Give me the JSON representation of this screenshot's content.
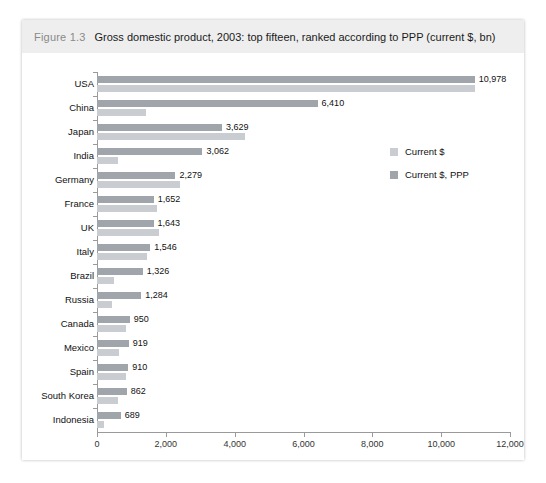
{
  "figure": {
    "number": "Figure 1.3",
    "title": "Gross domestic product, 2003: top fifteen, ranked according to PPP (current $, bn)"
  },
  "legend": {
    "position": "right-inside",
    "items": [
      {
        "label": "Current $",
        "key": "current",
        "color": "#c9ccd1"
      },
      {
        "label": "Current $, PPP",
        "key": "current_ppp",
        "color": "#9fa5ab"
      }
    ]
  },
  "axis": {
    "x_ticks": [
      "0",
      "2,000",
      "4,000",
      "6,000",
      "8,000",
      "10,000",
      "12,000"
    ],
    "x_tick_values": [
      0,
      2000,
      4000,
      6000,
      8000,
      10000,
      12000
    ],
    "x_min": 0,
    "x_max": 12000
  },
  "value_labels": [
    "10,978",
    "6,410",
    "3,629",
    "3,062",
    "2,279",
    "1,652",
    "1,643",
    "1,546",
    "1,326",
    "1,284",
    "950",
    "919",
    "910",
    "862",
    "689"
  ],
  "chart_data": {
    "type": "bar",
    "orientation": "horizontal",
    "title": "Gross domestic product, 2003: top fifteen, ranked according to PPP (current $, bn)",
    "xlabel": "",
    "ylabel": "",
    "xlim": [
      0,
      12000
    ],
    "grid": false,
    "legend_position": "right-inside",
    "categories": [
      "USA",
      "China",
      "Japan",
      "India",
      "Germany",
      "France",
      "UK",
      "Italy",
      "Brazil",
      "Russia",
      "Canada",
      "Mexico",
      "Spain",
      "South Korea",
      "Indonesia"
    ],
    "series": [
      {
        "name": "Current $, PPP",
        "color": "#9fa5ab",
        "labelled": true,
        "values": [
          10978,
          6410,
          3629,
          3062,
          2279,
          1652,
          1643,
          1546,
          1326,
          1284,
          950,
          919,
          910,
          862,
          689
        ]
      },
      {
        "name": "Current $",
        "color": "#c9ccd1",
        "labelled": false,
        "values": [
          10978,
          1410,
          4300,
          600,
          2400,
          1750,
          1795,
          1466,
          492,
          433,
          857,
          626,
          838,
          605,
          208
        ]
      }
    ],
    "annotations": [
      "10,978",
      "6,410",
      "3,629",
      "3,062",
      "2,279",
      "1,652",
      "1,643",
      "1,546",
      "1,326",
      "1,284",
      "950",
      "919",
      "910",
      "862",
      "689"
    ]
  }
}
